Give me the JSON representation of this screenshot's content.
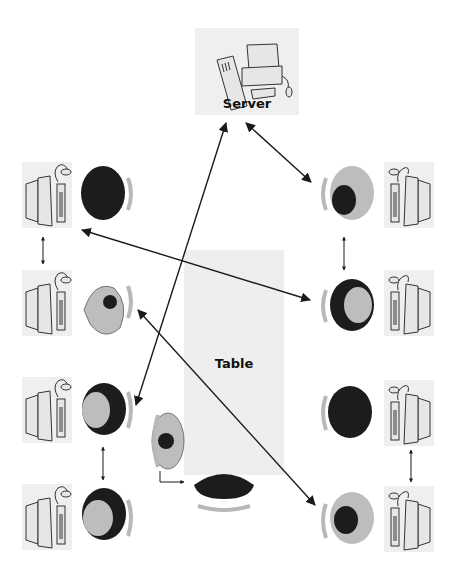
{
  "diagram": {
    "title": "",
    "nodes": {
      "server": {
        "label": "Server"
      },
      "table": {
        "label": "Table"
      }
    },
    "workstations": [
      {
        "id": "L1",
        "side": "left",
        "person": "dark"
      },
      {
        "id": "L2",
        "side": "left",
        "person": "light"
      },
      {
        "id": "L3",
        "side": "left",
        "person": "dark"
      },
      {
        "id": "L4",
        "side": "left",
        "person": "dark"
      },
      {
        "id": "R1",
        "side": "right",
        "person": "light"
      },
      {
        "id": "R2",
        "side": "right",
        "person": "dark"
      },
      {
        "id": "R3",
        "side": "right",
        "person": "dark"
      },
      {
        "id": "R4",
        "side": "right",
        "person": "light"
      }
    ],
    "table_seats": [
      {
        "id": "T1",
        "position": "left-of-table",
        "person": "light"
      },
      {
        "id": "T2",
        "position": "bottom-of-table",
        "person": "dark"
      }
    ],
    "connections": [
      {
        "from": "Server",
        "to": "R1",
        "type": "bidirectional"
      },
      {
        "from": "Server",
        "to": "L3",
        "type": "bidirectional"
      },
      {
        "from": "L1",
        "to": "R2",
        "type": "bidirectional"
      },
      {
        "from": "L2",
        "to": "R4",
        "type": "bidirectional"
      },
      {
        "from": "L1",
        "to": "L2",
        "type": "bidirectional"
      },
      {
        "from": "L3",
        "to": "L4",
        "type": "bidirectional"
      },
      {
        "from": "R1",
        "to": "R2",
        "type": "bidirectional"
      },
      {
        "from": "R3",
        "to": "R4",
        "type": "bidirectional"
      },
      {
        "from": "T1",
        "to": "T2",
        "type": "elbow"
      }
    ]
  },
  "colors": {
    "panel": "#efefef",
    "table": "#eeeeee",
    "arrow": "#1a1a1a",
    "person_dark": "#1c1c1c",
    "person_light": "#bdbdbd",
    "chair": "#b8b8b8"
  }
}
